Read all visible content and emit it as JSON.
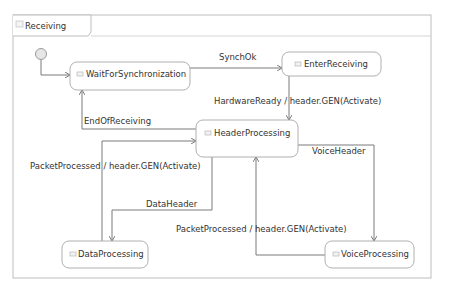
{
  "diagram": {
    "title": "Receiving",
    "states": [
      {
        "id": "wait",
        "label": "WaitForSynchronization"
      },
      {
        "id": "enter",
        "label": "EnterReceiving"
      },
      {
        "id": "header",
        "label": "HeaderProcessing"
      },
      {
        "id": "data",
        "label": "DataProcessing"
      },
      {
        "id": "voice",
        "label": "VoiceProcessing"
      }
    ],
    "transitions": [
      {
        "from": "initial",
        "to": "wait",
        "label": ""
      },
      {
        "from": "wait",
        "to": "enter",
        "label": "SynchOk"
      },
      {
        "from": "enter",
        "to": "header",
        "label": "HardwareReady / header.GEN(Activate)"
      },
      {
        "from": "header",
        "to": "wait",
        "label": "EndOfReceiving"
      },
      {
        "from": "data",
        "to": "header",
        "label": "PacketProcessed / header.GEN(Activate)"
      },
      {
        "from": "header",
        "to": "data",
        "label": "DataHeader"
      },
      {
        "from": "header",
        "to": "voice",
        "label": "VoiceHeader"
      },
      {
        "from": "voice",
        "to": "header",
        "label": "PacketProcessed / header.GEN(Activate)"
      }
    ],
    "colors": {
      "line": "#7a7a7a",
      "border": "#b8b8b8",
      "text": "#333333"
    }
  }
}
